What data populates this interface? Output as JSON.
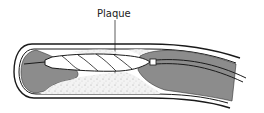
{
  "diagram": {
    "labels": [
      {
        "id": "plaque",
        "text": "Plaque"
      }
    ],
    "components": [
      {
        "name": "artery-wall",
        "icon": "artery-tube-shape"
      },
      {
        "name": "plaque-deposit",
        "icon": "stippled-plaque-shape"
      },
      {
        "name": "artery-lumen-blood",
        "icon": "gray-fill-shape"
      },
      {
        "name": "balloon-catheter",
        "icon": "twisted-balloon-shape"
      },
      {
        "name": "guide-wire",
        "icon": "wire-line"
      },
      {
        "name": "catheter-shaft",
        "icon": "double-line-tube"
      }
    ],
    "colors": {
      "lumen_fill": "#8c8c8c",
      "outline": "#1a1a1a",
      "plaque_fill": "#f2f2f2",
      "background": "#ffffff"
    }
  }
}
